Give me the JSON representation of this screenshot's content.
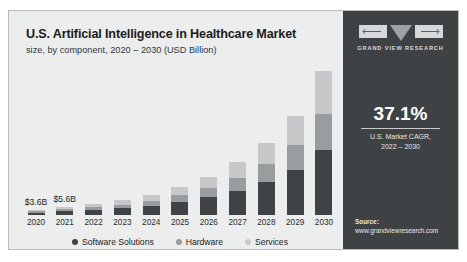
{
  "header": {
    "title": "U.S. Artificial Intelligence in Healthcare Market",
    "subtitle": "size, by component, 2020 – 2030 (USD Billion)"
  },
  "side_panel": {
    "logo_text": "GRAND VIEW RESEARCH",
    "cagr_value": "37.1%",
    "cagr_caption_line1": "U.S. Market CAGR,",
    "cagr_caption_line2": "2022 – 2030",
    "source_label": "Source:",
    "source_url": "www.grandviewresearch.com"
  },
  "colors": {
    "software": "#404346",
    "hardware": "#9a9da0",
    "services": "#c6c8ca",
    "panel": "#3f4245",
    "card": "#eceded"
  },
  "chart_data": {
    "type": "bar",
    "stacked": true,
    "title": "U.S. Artificial Intelligence in Healthcare Market",
    "subtitle": "size, by component, 2020 – 2030 (USD Billion)",
    "xlabel": "",
    "ylabel": "USD Billion",
    "ylim": [
      0,
      105
    ],
    "grid": false,
    "legend_position": "bottom",
    "categories": [
      "2020",
      "2021",
      "2022",
      "2023",
      "2024",
      "2025",
      "2026",
      "2027",
      "2028",
      "2029",
      "2030"
    ],
    "series": [
      {
        "name": "Software Solutions",
        "color": "#404346",
        "values": [
          1.7,
          2.6,
          3.5,
          4.8,
          6.6,
          9.1,
          12.5,
          17.1,
          23.5,
          32.2,
          45.9
        ]
      },
      {
        "name": "Hardware",
        "color": "#9a9da0",
        "values": [
          0.9,
          1.4,
          1.9,
          2.6,
          3.6,
          5.0,
          6.9,
          9.4,
          12.9,
          17.7,
          25.5
        ]
      },
      {
        "name": "Services",
        "color": "#c6c8ca",
        "values": [
          1.0,
          1.6,
          2.2,
          3.0,
          4.2,
          5.8,
          7.9,
          10.9,
          15.0,
          20.6,
          30.6
        ]
      }
    ],
    "totals": [
      3.6,
      5.6,
      7.6,
      10.4,
      14.4,
      19.9,
      27.3,
      37.4,
      51.4,
      70.5,
      102.0
    ],
    "data_labels": [
      {
        "category": "2020",
        "text": "$3.6B"
      },
      {
        "category": "2021",
        "text": "$5.6B"
      }
    ],
    "annotations": [
      {
        "text": "37.1%",
        "note": "U.S. Market CAGR, 2022 – 2030"
      }
    ]
  }
}
